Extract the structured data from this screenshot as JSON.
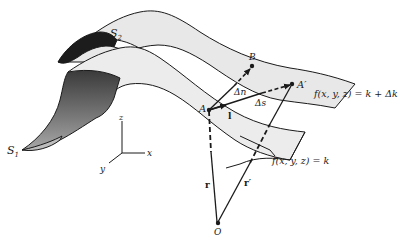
{
  "figure": {
    "surfaces": {
      "s1": {
        "label_main": "S",
        "label_sub": "1",
        "equation": "f(x, y, z) = k"
      },
      "s2": {
        "label_main": "S",
        "label_sub": "2",
        "equation": "f(x, y, z) = k + Δk"
      }
    },
    "points": {
      "A": "A",
      "A_prime": "A′",
      "B": "B",
      "O": "O"
    },
    "vectors": {
      "delta_n": "Δn",
      "delta_s": "Δs",
      "unit_l": "l",
      "r": "r",
      "r_prime": "r′"
    },
    "axes": {
      "x": "x",
      "y": "y",
      "z": "z"
    },
    "colors": {
      "ink": "#1a1a1a",
      "surface_fill": "#e9e9e9",
      "dark_edge": "#1c1c1c",
      "mid_edge": "#6b6b6b"
    }
  }
}
